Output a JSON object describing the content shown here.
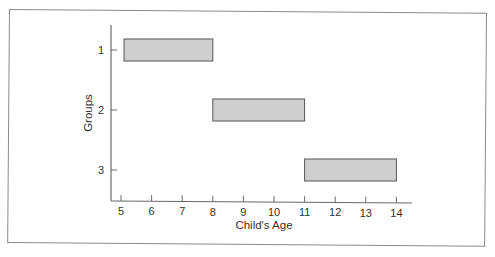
{
  "chart_data": {
    "type": "bar",
    "orientation": "horizontal-range",
    "title": "",
    "xlabel": "Child's Age",
    "ylabel": "Groups",
    "x_ticks": [
      5,
      6,
      7,
      8,
      9,
      10,
      11,
      12,
      13,
      14
    ],
    "y_ticks": [
      "1",
      "2",
      "3"
    ],
    "xlim": [
      4.7,
      14.5
    ],
    "grid": false,
    "legend": null,
    "series": [
      {
        "name": "Groups",
        "bars": [
          {
            "group": "1",
            "start": 5,
            "end": 8
          },
          {
            "group": "2",
            "start": 8,
            "end": 11
          },
          {
            "group": "3",
            "start": 11,
            "end": 14
          }
        ]
      }
    ],
    "colors": {
      "bar_fill": "#cfcfcf",
      "bar_stroke": "#555555",
      "axis": "#666666"
    }
  }
}
